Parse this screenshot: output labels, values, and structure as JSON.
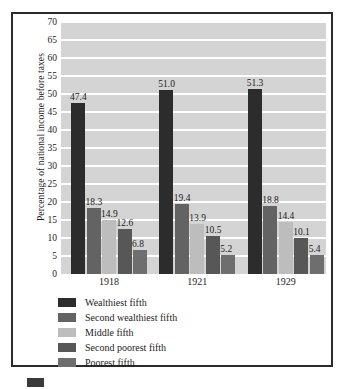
{
  "chart_data": {
    "type": "bar",
    "title": "",
    "subtitle": "",
    "xlabel": "",
    "ylabel": "Percentage of national income before taxes",
    "categories": [
      "1918",
      "1921",
      "1929"
    ],
    "ylim": [
      0,
      70
    ],
    "yticks": [
      0,
      5,
      10,
      15,
      20,
      25,
      30,
      35,
      40,
      45,
      50,
      55,
      60,
      65,
      70
    ],
    "ytick_labels": [
      "0",
      "5",
      "10",
      "15",
      "20",
      "25",
      "30",
      "35",
      "40",
      "45",
      "50",
      "55",
      "60",
      "65",
      "70"
    ],
    "grid": true,
    "grid_axis": "y",
    "legend_position": "bottom-left",
    "data_labels": true,
    "series": [
      {
        "name": "Wealthiest fifth",
        "color": "#2c2c2c",
        "values": [
          47.4,
          51.0,
          51.3
        ],
        "labels": [
          "47.4",
          "51.0",
          "51.3"
        ]
      },
      {
        "name": "Second wealthiest fifth",
        "color": "#636363",
        "values": [
          18.3,
          19.4,
          18.8
        ],
        "labels": [
          "18.3",
          "19.4",
          "18.8"
        ]
      },
      {
        "name": "Middle fifth",
        "color": "#bdbdbd",
        "values": [
          14.9,
          13.9,
          14.4
        ],
        "labels": [
          "14.9",
          "13.9",
          "14.4"
        ]
      },
      {
        "name": "Second poorest fifth",
        "color": "#575757",
        "values": [
          12.6,
          10.5,
          10.1
        ],
        "labels": [
          "12.6",
          "10.5",
          "10.1"
        ]
      },
      {
        "name": "Poorest fifth",
        "color": "#6e6e6e",
        "values": [
          6.8,
          5.2,
          5.4
        ],
        "labels": [
          "6.8",
          "5.2",
          "5.4"
        ]
      }
    ],
    "colors": {
      "plot_background": "#d4d4d4",
      "gridline": "#ffffff",
      "frame": "#2a2a2a",
      "text": "#1d1d1d"
    }
  },
  "legend": {
    "items": [
      {
        "label": "Wealthiest fifth",
        "color": "#2c2c2c"
      },
      {
        "label": "Second wealthiest fifth",
        "color": "#636363"
      },
      {
        "label": "Middle fifth",
        "color": "#bdbdbd"
      },
      {
        "label": "Second poorest fifth",
        "color": "#575757"
      },
      {
        "label": "Poorest fifth",
        "color": "#6e6e6e"
      }
    ]
  }
}
